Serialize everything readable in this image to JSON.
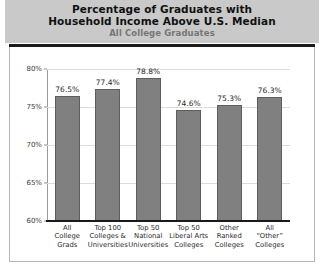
{
  "chart_data": {
    "type": "bar",
    "title": "Percentage of Graduates with Household Income Above U.S. Median",
    "title_line1": "Percentage of Graduates with",
    "title_line2": "Household Income Above U.S. Median",
    "subtitle": "All College Graduates",
    "xlabel": "",
    "ylabel": "",
    "ylim": [
      60,
      80
    ],
    "ytick_step": 5,
    "grid": true,
    "legend": "none",
    "categories": [
      "All College Grads",
      "Top 100 Colleges & Universities",
      "Top 50 National Universities",
      "Top 50 Liberal Arts Colleges",
      "Other Ranked Colleges",
      "All “Other” Colleges"
    ],
    "category_lines": [
      [
        "All",
        "College",
        "Grads"
      ],
      [
        "Top 100",
        "Colleges &",
        "Universities"
      ],
      [
        "Top 50",
        "National",
        "Universities"
      ],
      [
        "Top 50",
        "Liberal Arts",
        "Colleges"
      ],
      [
        "Other",
        "Ranked",
        "Colleges"
      ],
      [
        "All",
        "“Other”",
        "Colleges"
      ]
    ],
    "values": [
      76.5,
      77.4,
      78.8,
      74.6,
      75.3,
      76.3
    ],
    "value_labels": [
      "76.5%",
      "77.4%",
      "78.8%",
      "74.6%",
      "75.3%",
      "76.3%"
    ],
    "ytick_labels": [
      "80%",
      "75%",
      "70%",
      "65%",
      "60%"
    ],
    "ytick_values": [
      80,
      75,
      70,
      65,
      60
    ],
    "colors": {
      "bar_fill": "#808080",
      "bar_stroke": "#5e5e5e",
      "header_band": "#c9c9c9",
      "title_text": "#111111",
      "subtitle_text": "#767676",
      "gridline": "#dcdcdc",
      "axis": "#1a1a1a",
      "panel_background": "#ffffff",
      "panel_border": "#b5b5b5"
    }
  }
}
